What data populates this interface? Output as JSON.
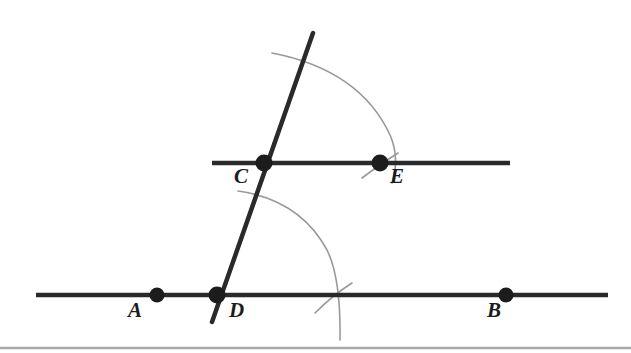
{
  "figure": {
    "background_color": "#ffffff",
    "line_color": "#2a2a2a",
    "arc_color": "#999999",
    "point_color": "#1c1c1c",
    "label_color": "#1c1c1c",
    "border_color": "#a8a8a8",
    "width": 631,
    "height": 353
  },
  "lines": [
    {
      "name": "lower-line-AB",
      "x1": 36,
      "y1": 295,
      "x2": 608,
      "y2": 295,
      "stroke_width": 4.5
    },
    {
      "name": "upper-line-CE",
      "x1": 212,
      "y1": 163,
      "x2": 510,
      "y2": 163,
      "stroke_width": 4.5
    },
    {
      "name": "transversal-line",
      "x1": 212,
      "y1": 322,
      "x2": 313,
      "y2": 33,
      "stroke_width": 4.5
    }
  ],
  "arcs": [
    {
      "name": "upper-compass-arc",
      "path": "M 272 53 Q 360 70 390 135 Q 400 158 392 183",
      "stroke_width": 1.6
    },
    {
      "name": "lower-compass-arc",
      "path": "M 238 191 Q 300 200 327 250 Q 341 278 340 340",
      "stroke_width": 1.6
    },
    {
      "name": "tick-mark-at-E",
      "path": "M 362 178 Q 380 164 398 153",
      "stroke_width": 1.6
    },
    {
      "name": "tick-mark-at-lower-intersection",
      "path": "M 315 313 Q 333 295 352 283",
      "stroke_width": 1.6
    }
  ],
  "points": [
    {
      "name": "point-A",
      "label": "A",
      "cx": 157,
      "cy": 295,
      "r": 7.5,
      "label_x": 128,
      "label_y": 300
    },
    {
      "name": "point-D",
      "label": "D",
      "cx": 217,
      "cy": 295,
      "r": 8.5,
      "label_x": 229,
      "label_y": 300
    },
    {
      "name": "point-B",
      "label": "B",
      "cx": 506,
      "cy": 295,
      "r": 7.5,
      "label_x": 487,
      "label_y": 300
    },
    {
      "name": "point-C",
      "label": "C",
      "cx": 264,
      "cy": 163,
      "r": 8.5,
      "label_x": 234,
      "label_y": 166
    },
    {
      "name": "point-E",
      "label": "E",
      "cx": 380,
      "cy": 163,
      "r": 8.5,
      "label_x": 390,
      "label_y": 166
    }
  ],
  "bottom_border": {
    "name": "bottom-border-rule",
    "x1": 0,
    "y1": 348,
    "x2": 631,
    "y2": 348,
    "stroke_width": 2.5
  }
}
